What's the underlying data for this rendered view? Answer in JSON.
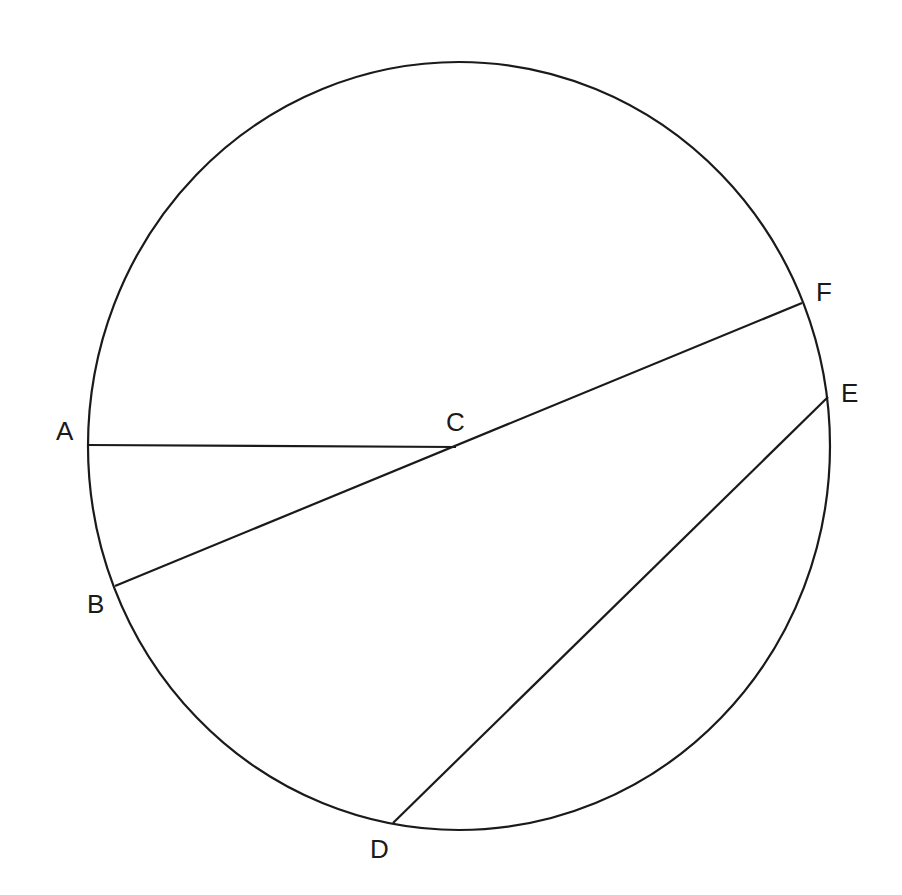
{
  "diagram": {
    "type": "circle-chords",
    "stroke_color": "#1a1a1a",
    "circle": {
      "cx": 459,
      "cy": 446,
      "rx": 371,
      "ry": 384
    },
    "points": {
      "A": {
        "label": "A",
        "x": 88,
        "y": 445,
        "lx": 56,
        "ly": 440
      },
      "B": {
        "label": "B",
        "x": 115,
        "y": 586,
        "lx": 87,
        "ly": 613
      },
      "C": {
        "label": "C",
        "x": 456,
        "y": 447,
        "lx": 446,
        "ly": 431
      },
      "D": {
        "label": "D",
        "x": 393,
        "y": 823,
        "lx": 370,
        "ly": 858
      },
      "E": {
        "label": "E",
        "x": 828,
        "y": 397,
        "lx": 841,
        "ly": 402
      },
      "F": {
        "label": "F",
        "x": 802,
        "y": 303,
        "lx": 816,
        "ly": 301
      }
    },
    "segments": [
      {
        "from": "A",
        "to": "C"
      },
      {
        "from": "B",
        "to": "F"
      },
      {
        "from": "D",
        "to": "E"
      }
    ]
  }
}
